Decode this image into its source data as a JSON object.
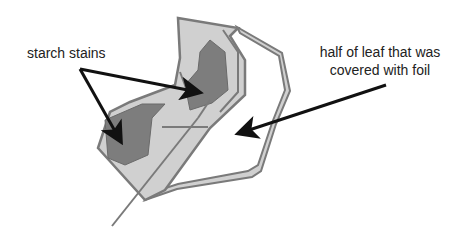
{
  "diagram": {
    "labels": {
      "starch_stains": "starch stains",
      "foil_half_line1": "half of leaf that was",
      "foil_half_line2": "covered with foil"
    },
    "colors": {
      "background": "#ffffff",
      "leaf_outline": "#7a7a7a",
      "leaf_fill_light": "#d0d0d0",
      "starch_fill": "#7d7d7d",
      "arrow": "#111111",
      "text": "#222222"
    },
    "parts": [
      "leaf",
      "uncovered-half",
      "foil-covered-half",
      "starch-stain-left",
      "starch-stain-upper",
      "stem-midrib",
      "arrows"
    ]
  }
}
